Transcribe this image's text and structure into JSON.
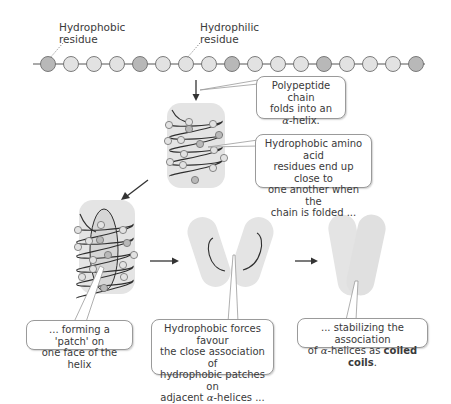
{
  "labels": {
    "hydrophobic": "Hydrophobic residue",
    "hydrophobic_line1": "Hydrophobic",
    "hydrophobic_line2": "residue",
    "hydrophilic_line1": "Hydrophilic",
    "hydrophilic_line2": "residue"
  },
  "chain": {
    "bead_count": 17,
    "hydrophobic_positions": [
      1,
      5,
      9,
      13,
      17
    ],
    "colors": {
      "hydrophobic": "#b8b8b8",
      "hydrophilic": "#e2e2e2",
      "outline": "#6e6e6e",
      "backbone": "#555555"
    }
  },
  "callouts": {
    "fold": {
      "line1": "Polypeptide chain",
      "line2": "folds into an",
      "alpha": "α",
      "line3_rest": "-helix."
    },
    "close": {
      "line1": "Hydrophobic amino acid",
      "line2": "residues end up close to",
      "line3": "one another when the",
      "line4": "chain is folded ..."
    },
    "patch": {
      "line1": "... forming a 'patch' on",
      "line2": "one face of the helix"
    },
    "forces": {
      "line1": "Hydrophobic forces favour",
      "line2": "the close association of",
      "line3": "hydrophobic patches on",
      "line4_pre": "adjacent ",
      "alpha": "α",
      "line4_rest": "-helices ..."
    },
    "stabilize": {
      "line1": "... stabilizing the association",
      "line2_pre": "of ",
      "alpha": "α",
      "line2_mid": "-helices as ",
      "line2_bold": "coiled coils",
      "line2_end": "."
    }
  },
  "colors": {
    "cylinder": "#e4e4e4",
    "helix_line": "#2e2e2e",
    "arrow": "#333333",
    "callout_border": "#9a9a9a"
  }
}
